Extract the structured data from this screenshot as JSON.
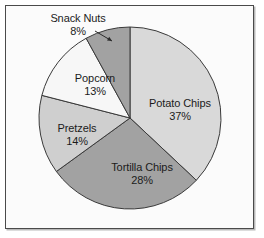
{
  "figure": {
    "frame_border_color": "#4a4a4a",
    "background_color": "#fbfbfb",
    "page_background": "#ffffff"
  },
  "chart_data": {
    "type": "pie",
    "title": "",
    "subtitle": "",
    "xlabel": "",
    "ylabel": "",
    "legend_position": "none",
    "grid": false,
    "start_angle_deg": 90,
    "direction": "clockwise",
    "units": "percent",
    "categories": [
      "Potato Chips",
      "Tortilla Chips",
      "Pretzels",
      "Popcorn",
      "Snack Nuts"
    ],
    "values": [
      37,
      28,
      14,
      13,
      8
    ],
    "value_labels": [
      "37%",
      "28%",
      "14%",
      "13%",
      "8%"
    ],
    "colors": [
      "#d9d9d9",
      "#a2a2a2",
      "#cfcfcf",
      "#f7f7f7",
      "#a2a2a2"
    ],
    "slice_edge_color": "#3a3a3a",
    "slices": [
      {
        "name": "Potato Chips",
        "value": 37,
        "value_label": "37%",
        "color": "#d9d9d9",
        "label_placement": "inside",
        "label_x": 180,
        "label_y": 97
      },
      {
        "name": "Tortilla Chips",
        "value": 28,
        "value_label": "28%",
        "color": "#a2a2a2",
        "label_placement": "inside",
        "label_x": 142,
        "label_y": 161
      },
      {
        "name": "Pretzels",
        "value": 14,
        "value_label": "14%",
        "color": "#cfcfcf",
        "label_placement": "inside",
        "label_x": 77,
        "label_y": 122
      },
      {
        "name": "Popcorn",
        "value": 13,
        "value_label": "13%",
        "color": "#f7f7f7",
        "label_placement": "inside",
        "label_x": 95,
        "label_y": 72
      },
      {
        "name": "Snack Nuts",
        "value": 8,
        "value_label": "8%",
        "color": "#a2a2a2",
        "label_placement": "outside-leader",
        "label_x": 78,
        "label_y": 12,
        "leader_line": {
          "from_x": 95,
          "from_y": 31,
          "to_x": 112,
          "to_y": 41
        }
      }
    ]
  },
  "geometry": {
    "center_x": 130,
    "center_y": 118,
    "radius": 91
  }
}
